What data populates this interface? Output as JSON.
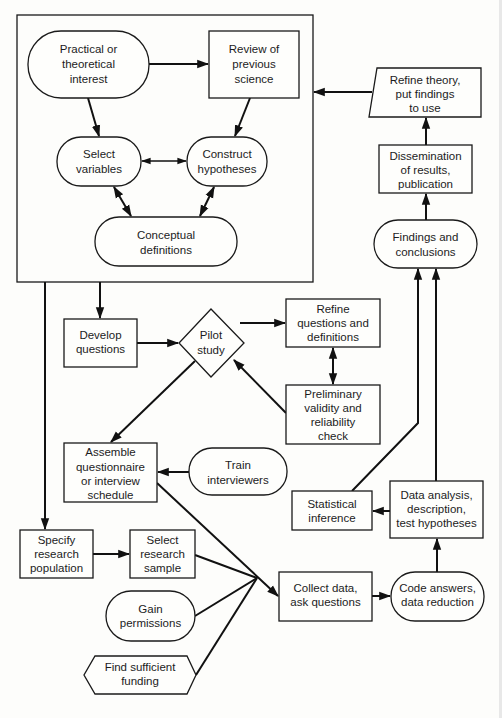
{
  "diagram": {
    "type": "flowchart",
    "title": "",
    "nodes": {
      "practical_interest": {
        "shape": "stadium",
        "lines": [
          "Practical or",
          "theoretical",
          "interest"
        ]
      },
      "review_science": {
        "shape": "rectangle",
        "lines": [
          "Review of",
          "previous",
          "science"
        ]
      },
      "select_variables": {
        "shape": "stadium",
        "lines": [
          "Select",
          "variables"
        ]
      },
      "construct_hypotheses": {
        "shape": "stadium",
        "lines": [
          "Construct",
          "hypotheses"
        ]
      },
      "conceptual_definitions": {
        "shape": "stadium",
        "lines": [
          "Conceptual",
          "definitions"
        ]
      },
      "refine_theory": {
        "shape": "trapezoid",
        "lines": [
          "Refine theory,",
          "put findings",
          "to use"
        ]
      },
      "dissemination": {
        "shape": "rectangle",
        "lines": [
          "Dissemination",
          "of results,",
          "publication"
        ]
      },
      "findings": {
        "shape": "stadium",
        "lines": [
          "Findings and",
          "conclusions"
        ]
      },
      "develop_questions": {
        "shape": "rectangle",
        "lines": [
          "Develop",
          "questions"
        ]
      },
      "pilot_study": {
        "shape": "diamond",
        "lines": [
          "Pilot",
          "study"
        ]
      },
      "refine_questions": {
        "shape": "rectangle",
        "lines": [
          "Refine",
          "questions and",
          "definitions"
        ]
      },
      "preliminary_check": {
        "shape": "rectangle",
        "lines": [
          "Preliminary",
          "validity and",
          "reliability",
          "check"
        ]
      },
      "assemble_questionnaire": {
        "shape": "rectangle",
        "lines": [
          "Assemble",
          "questionnaire",
          "or interview",
          "schedule"
        ]
      },
      "train_interviewers": {
        "shape": "stadium",
        "lines": [
          "Train",
          "interviewers"
        ]
      },
      "statistical_inference": {
        "shape": "rectangle",
        "lines": [
          "Statistical",
          "inference"
        ]
      },
      "data_analysis": {
        "shape": "rectangle",
        "lines": [
          "Data analysis,",
          "description,",
          "test hypotheses"
        ]
      },
      "specify_population": {
        "shape": "rectangle",
        "lines": [
          "Specify",
          "research",
          "population"
        ]
      },
      "select_sample": {
        "shape": "rectangle",
        "lines": [
          "Select",
          "research",
          "sample"
        ]
      },
      "gain_permissions": {
        "shape": "stadium",
        "lines": [
          "Gain",
          "permissions"
        ]
      },
      "find_funding": {
        "shape": "hexagon",
        "lines": [
          "Find sufficient",
          "funding"
        ]
      },
      "collect_data": {
        "shape": "rectangle",
        "lines": [
          "Collect data,",
          "ask questions"
        ]
      },
      "code_answers": {
        "shape": "stadium",
        "lines": [
          "Code answers,",
          "data reduction"
        ]
      }
    },
    "edges": [
      {
        "from": "practical_interest",
        "to": "review_science",
        "type": "arrow"
      },
      {
        "from": "practical_interest",
        "to": "select_variables",
        "type": "arrow"
      },
      {
        "from": "review_science",
        "to": "construct_hypotheses",
        "type": "arrow"
      },
      {
        "from": "select_variables",
        "to": "construct_hypotheses",
        "type": "bidirectional"
      },
      {
        "from": "select_variables",
        "to": "conceptual_definitions",
        "type": "bidirectional"
      },
      {
        "from": "construct_hypotheses",
        "to": "conceptual_definitions",
        "type": "bidirectional"
      },
      {
        "from": "refine_theory",
        "to": "theory_group",
        "type": "arrow"
      },
      {
        "from": "dissemination",
        "to": "refine_theory",
        "type": "arrow"
      },
      {
        "from": "findings",
        "to": "dissemination",
        "type": "arrow"
      },
      {
        "from": "theory_group",
        "to": "develop_questions",
        "type": "arrow"
      },
      {
        "from": "theory_group",
        "to": "specify_population",
        "type": "arrow"
      },
      {
        "from": "develop_questions",
        "to": "pilot_study",
        "type": "arrow"
      },
      {
        "from": "pilot_study",
        "to": "refine_questions",
        "type": "arrow"
      },
      {
        "from": "refine_questions",
        "to": "preliminary_check",
        "type": "bidirectional"
      },
      {
        "from": "preliminary_check",
        "to": "pilot_study",
        "type": "arrow"
      },
      {
        "from": "pilot_study",
        "to": "assemble_questionnaire",
        "type": "arrow"
      },
      {
        "from": "train_interviewers",
        "to": "assemble_questionnaire",
        "type": "arrow"
      },
      {
        "from": "specify_population",
        "to": "select_sample",
        "type": "arrow"
      },
      {
        "from": "assemble_questionnaire",
        "to": "collect_data",
        "type": "arrow"
      },
      {
        "from": "select_sample",
        "to": "collect_data",
        "type": "arrow"
      },
      {
        "from": "gain_permissions",
        "to": "collect_data",
        "type": "arrow"
      },
      {
        "from": "find_funding",
        "to": "collect_data",
        "type": "arrow"
      },
      {
        "from": "collect_data",
        "to": "code_answers",
        "type": "arrow"
      },
      {
        "from": "code_answers",
        "to": "data_analysis",
        "type": "arrow"
      },
      {
        "from": "data_analysis",
        "to": "statistical_inference",
        "type": "arrow"
      },
      {
        "from": "data_analysis",
        "to": "findings",
        "type": "arrow"
      },
      {
        "from": "statistical_inference",
        "to": "findings",
        "type": "arrow"
      }
    ]
  }
}
